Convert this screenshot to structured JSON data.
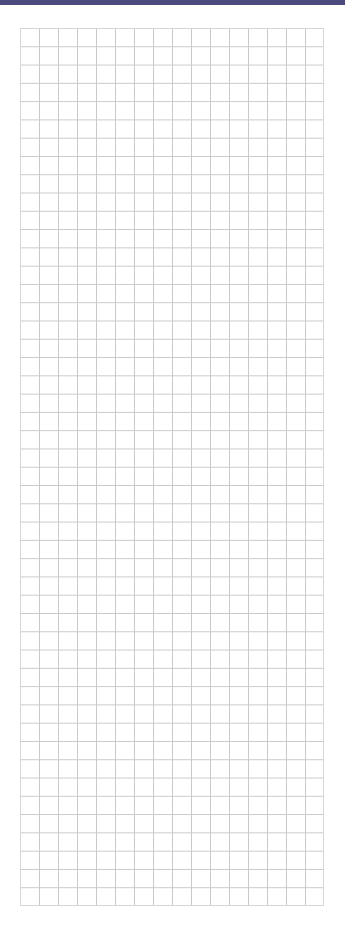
{
  "page": {
    "top_bar": {
      "color": "#4a4a7e"
    },
    "grid": {
      "columns": 16,
      "rows": 48,
      "cell_width_px": 19,
      "cell_height_px": 18.3,
      "line_color": "#c9c9c9",
      "background_color": "#ffffff"
    }
  }
}
